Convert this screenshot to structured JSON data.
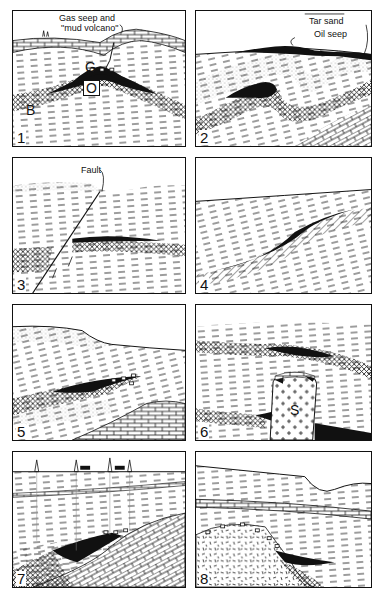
{
  "figure": {
    "panels": [
      {
        "number": "1",
        "labels": {
          "gas_seep": "Gas seep and",
          "mud_volcano": "\"mud volcano\"",
          "gas": "G",
          "oil": "O",
          "brine": "B"
        }
      },
      {
        "number": "2",
        "labels": {
          "tar_sand": "Tar sand",
          "oil_seep": "Oil seep"
        }
      },
      {
        "number": "3",
        "labels": {
          "fault": "Fault"
        }
      },
      {
        "number": "4",
        "labels": {}
      },
      {
        "number": "5",
        "labels": {}
      },
      {
        "number": "6",
        "labels": {
          "salt": "S"
        }
      },
      {
        "number": "7",
        "labels": {}
      },
      {
        "number": "8",
        "labels": {}
      }
    ]
  },
  "colors": {
    "ink": "#111111",
    "background": "#ffffff"
  }
}
